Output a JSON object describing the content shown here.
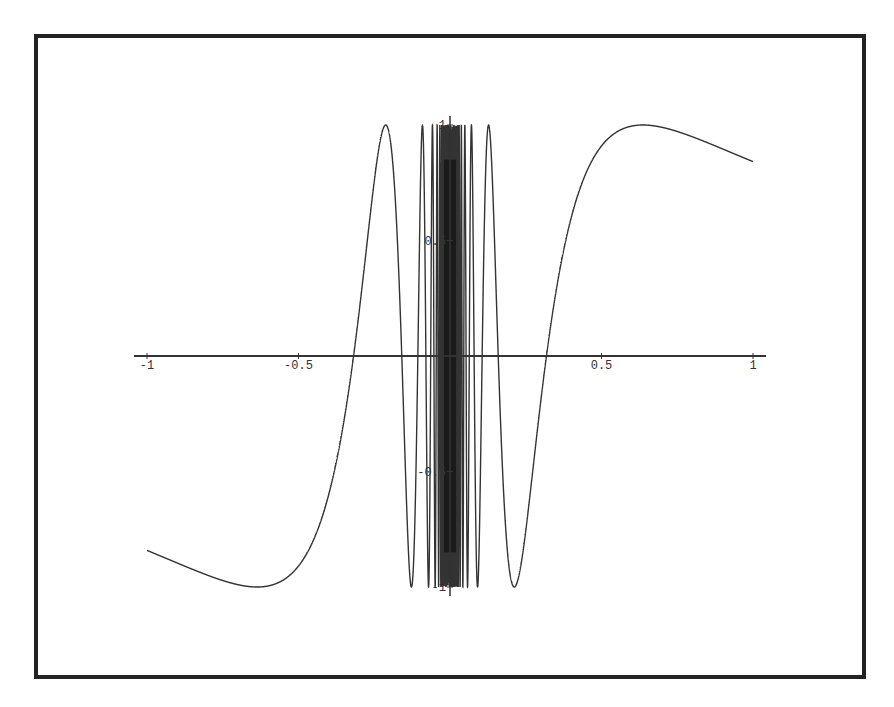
{
  "chart_data": {
    "type": "line",
    "title": "",
    "function": "sin(1/x)",
    "xlabel": "",
    "ylabel": "",
    "xlim": [
      -1,
      1
    ],
    "ylim": [
      -1,
      1
    ],
    "grid": false,
    "legend": null,
    "x_ticks": [
      -1,
      -0.5,
      0.5,
      1
    ],
    "x_tick_labels": [
      "-1",
      "-0.5",
      "0.5",
      "1"
    ],
    "y_ticks": [
      1,
      0.5,
      -0.5,
      -1
    ],
    "y_tick_labels": [
      "1",
      "0.5",
      "-0.5",
      "-1"
    ],
    "series": [
      {
        "name": "sin(1/x)",
        "x": [
          -1,
          -0.9,
          -0.8,
          -0.7,
          -0.64,
          -0.6,
          -0.5,
          -0.4,
          -0.3,
          -0.21,
          -0.15,
          -0.1,
          0.1,
          0.15,
          0.21,
          0.3,
          0.4,
          0.5,
          0.6,
          0.64,
          0.7,
          0.8,
          0.9,
          1
        ],
        "values": [
          -0.84,
          -0.9,
          -0.95,
          -0.99,
          -1.0,
          -0.995,
          -0.91,
          -0.6,
          0.19,
          1.0,
          -0.41,
          0.54,
          -0.54,
          0.41,
          -1.0,
          -0.19,
          0.6,
          0.91,
          0.995,
          1.0,
          0.99,
          0.95,
          0.9,
          0.84
        ]
      }
    ]
  },
  "colors": {
    "frame": "#222222",
    "axis": "#333333",
    "curve": "#333333",
    "background": "#ffffff"
  }
}
